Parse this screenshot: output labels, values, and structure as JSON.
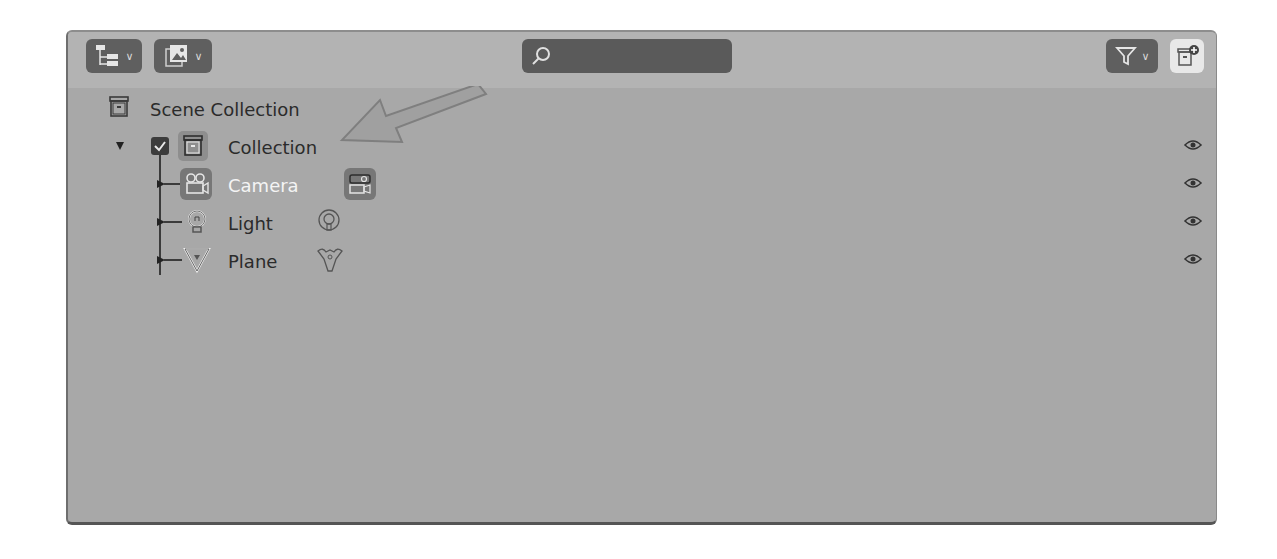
{
  "header": {
    "display_mode_icon": "outliner-display-mode-icon",
    "filter_icon": "filter-icon",
    "search": {
      "value": "",
      "placeholder": ""
    },
    "new_collection_icon": "new-collection-icon"
  },
  "tree": {
    "scene_collection": {
      "label": "Scene Collection",
      "icon": "scene-collection-icon"
    },
    "collection": {
      "label": "Collection",
      "icon": "collection-icon",
      "expanded": true,
      "checked": true,
      "visible": true
    },
    "objects": [
      {
        "label": "Camera",
        "icon": "camera-object-icon",
        "data_icon": "camera-data-icon",
        "active": true,
        "visible": true
      },
      {
        "label": "Light",
        "icon": "light-object-icon",
        "data_icon": "light-data-icon",
        "active": false,
        "visible": true
      },
      {
        "label": "Plane",
        "icon": "mesh-object-icon",
        "data_icon": "mesh-data-icon",
        "active": false,
        "visible": true
      }
    ]
  },
  "annotation": {
    "arrow_color": "#8c8c8c",
    "points_to": "Collection"
  },
  "colors": {
    "panel_bg": "#a8a8a8",
    "header_bg": "#b3b3b3",
    "button_bg": "#5f5f5f",
    "active_text": "#f4f4f4",
    "text": "#2b2b2b"
  }
}
